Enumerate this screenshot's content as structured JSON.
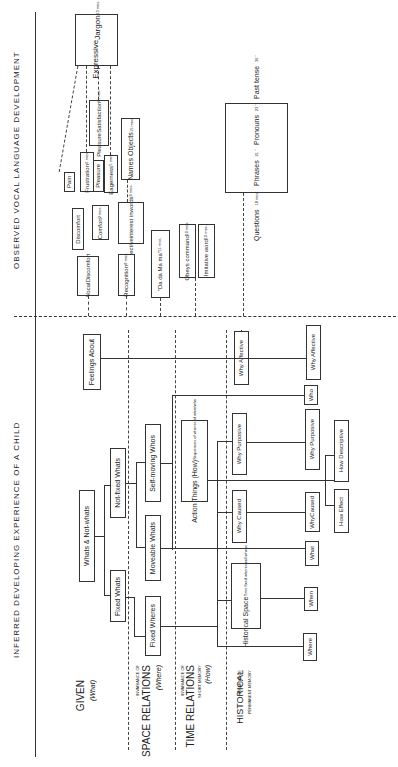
{
  "headers": {
    "observed": "OBSERVED VOCAL LANGUAGE DEVELOPMENT",
    "inferred": "INFERRED DEVELOPING EXPERIENCE OF A CHILD"
  },
  "rows": {
    "given": {
      "title": "GIVEN",
      "sub": "(What)"
    },
    "space": {
      "pre": "INVARIANCE OF",
      "title": "SPACE RELATIONS",
      "sub": "(Where)"
    },
    "time": {
      "pre": "INVARIANCE OF",
      "title": "TIME RELATIONS",
      "note": "SHORT MEMORY",
      "sub": "(How)"
    },
    "historical": {
      "title": "HISTORICAL",
      "note1": "INVARIANCE",
      "note2": "PERMANENT MEMORY"
    }
  },
  "vocal": {
    "expressive_jargon": {
      "line1": "Expressive",
      "line2": "Jargon",
      "age": "13 mos."
    },
    "pain": "Pain",
    "frustration": {
      "label": "Frustration",
      "age": "6 mos."
    },
    "pleasure_satisfaction": {
      "line1": "Pleasure",
      "line2": "Satisfaction",
      "age": "6 mos."
    },
    "pleasure": "Pleasure",
    "eagerness": {
      "label": "Eagerness",
      "age": "5 mos."
    },
    "names_objects": {
      "label": "Names Objects",
      "age": "15 mos."
    },
    "discomfort": "Discomfort",
    "comfort": {
      "label": "Comfort",
      "age": "2 mos."
    },
    "selective_interest": {
      "line1": "Selective",
      "line2": "interest in",
      "line3": "words",
      "age": "9 mos."
    },
    "vocal_discomfort": {
      "line1": "Vocal",
      "line2": "Discomfort"
    },
    "recognition": {
      "label": "Recognition",
      "age": "8 mos."
    },
    "dada_mama": {
      "label": "\"Da da  Ma ma\"",
      "age": "11 mos."
    },
    "obeys_command": {
      "label": "Obeys command",
      "age": "10 mos."
    },
    "imitative_word": {
      "label": "Imitative word",
      "age": "10 mos."
    },
    "milestones": [
      {
        "label": "Questions",
        "age": "18 mos."
      },
      {
        "label": "Phrases",
        "age": "21  \""
      },
      {
        "label": "Pronouns",
        "age": "23  \""
      },
      {
        "label": "Past tense",
        "age": "36  \""
      }
    ]
  },
  "inferred": {
    "feelings_about": "Feelings About",
    "why_affective_1": "Why Affective",
    "why_affective_2": "Why Affective",
    "whats_not_whats": "Whats & Not-whats",
    "not_fixed_whats": "Not-fixed Whats",
    "fixed_whats": "Fixed Whats",
    "self_moving_whos": "Self-moving Whos",
    "moveable_whats": "Moveable Whats",
    "fixed_wheres": "Fixed Wheres",
    "action_things": {
      "line1": "Action Things (How)",
      "line2": "Sequences of wheres of what/who"
    },
    "who": "Who",
    "why_purposive_1": "Why Purposive",
    "why_purposive_2": "Why Purposive",
    "how_descriptive": "How Descriptive",
    "why_caused_1": "Why Caused",
    "why_caused_2": {
      "line1": "Why",
      "line2": "Caused"
    },
    "how_effect": "How Effect",
    "what": "What",
    "historical_space": {
      "line1": "Historical Space",
      "line2": "Time fixed wheres",
      "line3": "and whens"
    },
    "when": "When",
    "where": "Where"
  }
}
